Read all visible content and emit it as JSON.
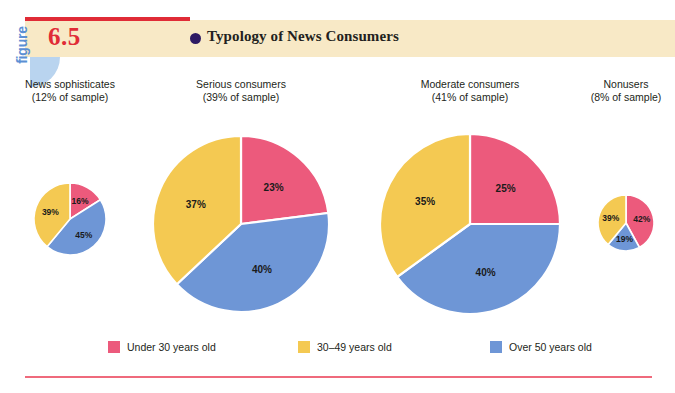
{
  "figure": {
    "word": "figure",
    "number": "6.5",
    "title": "Typology of News Consumers",
    "bullet_icon": "filled-circle-bullet"
  },
  "colors": {
    "pink": "#ec5a7c",
    "yellow": "#f4c952",
    "blue": "#6e96d6",
    "band": "#f8e9c6",
    "rule_red": "#e02b36",
    "rule_pink": "#ef6a7c",
    "title_bullet": "#2e1a63",
    "figure_word": "#5b8fd4",
    "figure_blob": "#b9d4ef"
  },
  "legend": {
    "items": [
      {
        "label": "Under 30 years old",
        "color": "#ec5a7c",
        "key": "under30"
      },
      {
        "label": "30–49 years old",
        "color": "#f4c952",
        "key": "age3049"
      },
      {
        "label": "Over 50 years old",
        "color": "#6e96d6",
        "key": "over50"
      }
    ]
  },
  "groups": [
    {
      "name": "News sophisticates",
      "share": "(12% of sample)",
      "labels": [
        "16%",
        "39%",
        "45%"
      ]
    },
    {
      "name": "Serious consumers",
      "share": "(39% of sample)",
      "labels": [
        "23%",
        "37%",
        "40%"
      ]
    },
    {
      "name": "Moderate consumers",
      "share": "(41% of sample)",
      "labels": [
        "25%",
        "35%",
        "40%"
      ]
    },
    {
      "name": "Nonusers",
      "share": "(8% of sample)",
      "labels": [
        "42%",
        "39%",
        "19%"
      ]
    }
  ],
  "chart_data": {
    "type": "pie",
    "title": "Typology of News Consumers",
    "subtitle": "",
    "xlabel": "",
    "ylabel": "",
    "legend_position": "bottom",
    "grid": false,
    "series_names": [
      "Under 30 years old",
      "30–49 years old",
      "Over 50 years old"
    ],
    "series_colors": [
      "#ec5a7c",
      "#f4c952",
      "#6e96d6"
    ],
    "charts": [
      {
        "name": "News sophisticates",
        "group_share_percent": 12,
        "group_share_text": "(12% of sample)",
        "slices": [
          {
            "name": "Under 30 years old",
            "value": 16,
            "label": "16%"
          },
          {
            "name": "30–49 years old",
            "value": 39,
            "label": "39%"
          },
          {
            "name": "Over 50 years old",
            "value": 45,
            "label": "45%"
          }
        ]
      },
      {
        "name": "Serious consumers",
        "group_share_percent": 39,
        "group_share_text": "(39% of sample)",
        "slices": [
          {
            "name": "Under 30 years old",
            "value": 23,
            "label": "23%"
          },
          {
            "name": "30–49 years old",
            "value": 37,
            "label": "37%"
          },
          {
            "name": "Over 50 years old",
            "value": 40,
            "label": "40%"
          }
        ]
      },
      {
        "name": "Moderate consumers",
        "group_share_percent": 41,
        "group_share_text": "(41% of sample)",
        "slices": [
          {
            "name": "Under 30 years old",
            "value": 25,
            "label": "25%"
          },
          {
            "name": "30–49 years old",
            "value": 35,
            "label": "35%"
          },
          {
            "name": "Over 50 years old",
            "value": 40,
            "label": "40%"
          }
        ]
      },
      {
        "name": "Nonusers",
        "group_share_percent": 8,
        "group_share_text": "(8% of sample)",
        "slices": [
          {
            "name": "Under 30 years old",
            "value": 42,
            "label": "42%"
          },
          {
            "name": "30–49 years old",
            "value": 39,
            "label": "39%"
          },
          {
            "name": "Over 50 years old",
            "value": 19,
            "label": "19%"
          }
        ]
      }
    ]
  },
  "geometry": {
    "pies": [
      {
        "cx": 70,
        "cy": 219,
        "r": 36,
        "label_x": 70,
        "label_top": 78,
        "label_w": 140
      },
      {
        "cx": 241,
        "cy": 224,
        "r": 88,
        "label_x": 241,
        "label_top": 78,
        "label_w": 160
      },
      {
        "cx": 470,
        "cy": 224,
        "r": 90,
        "label_x": 470,
        "label_top": 78,
        "label_w": 170
      },
      {
        "cx": 626,
        "cy": 223,
        "r": 28,
        "label_x": 626,
        "label_top": 78,
        "label_w": 120
      }
    ],
    "legend_x": [
      0,
      190,
      382
    ]
  }
}
